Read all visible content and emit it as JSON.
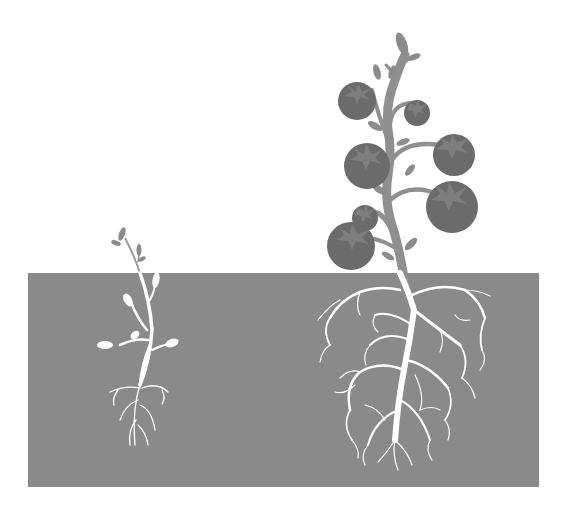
{
  "illustration": {
    "subject": "seedling vs mature tomato plant root comparison",
    "colors": {
      "background": "#ffffff",
      "soil": "#8a8a8a",
      "stem": "#8f8f8f",
      "leaf": "#8c8c8c",
      "tomato": "#6b6b6b",
      "tomato_calyx": "#7e7e7e",
      "roots": "#ffffff"
    },
    "soil": {
      "x": 28,
      "y": 273,
      "width": 511,
      "height": 214
    },
    "seedling": {
      "label": "seedling",
      "base_x": 140,
      "above_ground_top_y": 228
    },
    "mature_plant": {
      "label": "tomato-plant",
      "tomatoes": [
        {
          "cx": 357,
          "cy": 101,
          "r": 19
        },
        {
          "cx": 417,
          "cy": 113,
          "r": 13
        },
        {
          "cx": 367,
          "cy": 166,
          "r": 23
        },
        {
          "cx": 454,
          "cy": 155,
          "r": 21
        },
        {
          "cx": 452,
          "cy": 207,
          "r": 26
        },
        {
          "cx": 365,
          "cy": 218,
          "r": 13
        },
        {
          "cx": 351,
          "cy": 246,
          "r": 24
        }
      ]
    }
  }
}
